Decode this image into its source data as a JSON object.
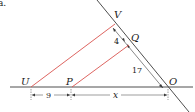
{
  "problem_label": "a.",
  "points": {
    "U": "U",
    "P": "P",
    "V": "V",
    "Q": "Q",
    "O": "O"
  },
  "measurements": {
    "VQ": "4",
    "QO": "17",
    "UP": "9",
    "PO": "x"
  },
  "colors": {
    "line": "#3a3a3a",
    "parallel": "#d9534f",
    "text": "#1a1a1a"
  }
}
